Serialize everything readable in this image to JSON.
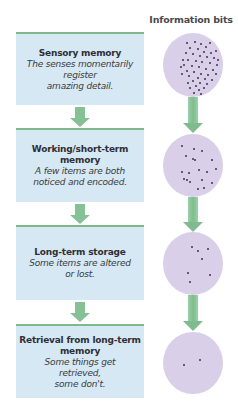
{
  "header": {
    "information_label": "Information bits"
  },
  "stages": [
    {
      "title": "Sensory memory",
      "description_lines": [
        "The senses momentarily",
        "register",
        "amazing detail."
      ]
    },
    {
      "title_lines": [
        "Working/short-term",
        "memory"
      ],
      "description_lines": [
        "A few items are both",
        "noticed and encoded."
      ]
    },
    {
      "title": "Long-term storage",
      "description_lines": [
        "Some items are altered",
        "or lost."
      ]
    },
    {
      "title_lines": [
        "Retrieval from long-term",
        "memory"
      ],
      "description_lines": [
        "Some things get",
        "retrieved,",
        "some don't."
      ]
    }
  ],
  "information_bits": [
    {
      "stage": "sensory",
      "dot_count": 48
    },
    {
      "stage": "working",
      "dot_count": 19
    },
    {
      "stage": "long-term",
      "dot_count": 7
    },
    {
      "stage": "retrieval",
      "dot_count": 2
    }
  ],
  "colors": {
    "box_fill": "#d6e8f4",
    "box_top_rule": "#7fb88a",
    "arrow": "#86c196",
    "circle_fill": "#d9cfe8",
    "dot": "#3b3450"
  }
}
